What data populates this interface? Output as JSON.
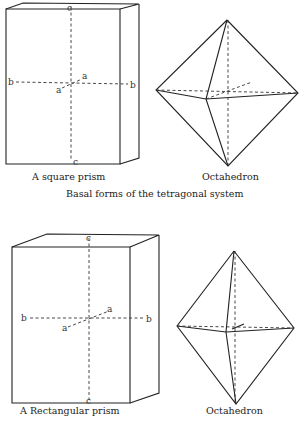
{
  "top": {
    "prism": {
      "caption": "A square prism",
      "axis_labels": {
        "c_top": "c",
        "c_bottom": "c",
        "b_left": "b",
        "b_right": "b",
        "a_front": "a",
        "a_back": "a"
      }
    },
    "octahedron": {
      "caption": "Octahedron"
    },
    "section_caption": "Basal forms of the tetragonal system"
  },
  "bottom": {
    "prism": {
      "caption": "A Rectangular prism",
      "axis_labels": {
        "c_top": "c",
        "c_bottom": "c",
        "b_left": "b",
        "b_right": "b",
        "a_front": "a",
        "a_back": "a"
      }
    },
    "octahedron": {
      "caption": "Octahedron"
    }
  }
}
